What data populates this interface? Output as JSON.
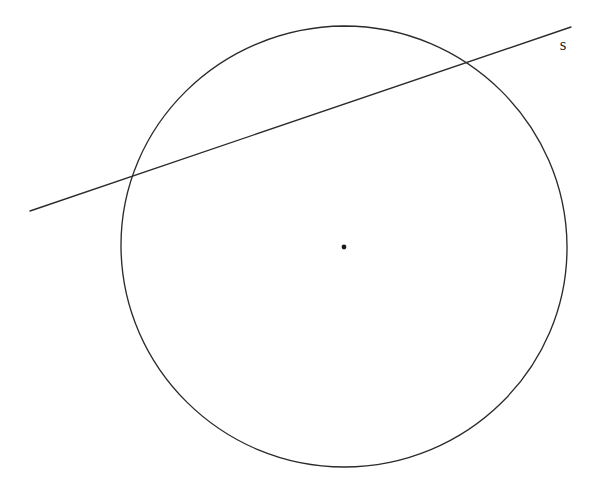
{
  "figure": {
    "background_color": "#ffffff",
    "stroke_color": "#2b2b2b",
    "dot_color": "#1a1a1a",
    "label_color": "#1f1f1f",
    "width": 603,
    "height": 502
  },
  "circle": {
    "name": "circle-outline",
    "center_x": 344,
    "center_y": 247,
    "radius_x": 222,
    "radius_y": 220,
    "left_x": 121,
    "right_x": 567,
    "top_y": 26,
    "bottom_y": 467,
    "path": "M 344 26 C 466 26 566 125 567 246 C 568 368 467 467 344 467 C 222 467 122 368 121 247 C 120 125 221 27 344 26 Z"
  },
  "center_point": {
    "name": "circle-center-dot",
    "x": 344,
    "y": 247,
    "radius": 2.4
  },
  "secant_line": {
    "name": "secant-line-s",
    "x1": 30,
    "y1": 211,
    "x2": 571,
    "y2": 27,
    "slope": -0.34,
    "intersection_left_x": 130,
    "intersection_left_y": 176,
    "intersection_right_x": 470,
    "intersection_right_y": 63
  },
  "labels": {
    "secant": {
      "name": "secant-label",
      "text": "s",
      "x": 563,
      "y": 46
    }
  }
}
